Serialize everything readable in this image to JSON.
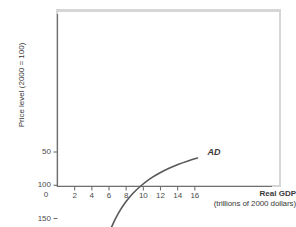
{
  "chart_data": {
    "type": "line",
    "title": "",
    "xlabel": "Real GDP",
    "xlabel_sub": "(trillions of 2000 dollars)",
    "ylabel": "Price level (2000 = 100)",
    "xlim": [
      0,
      18
    ],
    "ylim": [
      0,
      215
    ],
    "grid": false,
    "legend_position": "inline-annotation",
    "xticks": [
      2,
      4,
      6,
      8,
      10,
      12,
      14,
      16
    ],
    "xtick_labels": [
      "2",
      "4",
      "6",
      "8",
      "10",
      "12",
      "14",
      "16"
    ],
    "yticks": [
      50,
      100,
      150
    ],
    "ytick_labels": [
      "50",
      "100",
      "150"
    ],
    "origin_label": "0",
    "annotations": [
      {
        "text": "AD",
        "x": 17.0,
        "y": 52,
        "style": "italic"
      }
    ],
    "series": [
      {
        "name": "AD",
        "label": "AD",
        "color": "#595959",
        "width": 1.6,
        "x": [
          5.3,
          5.8,
          6.4,
          7.1,
          7.9,
          8.8,
          9.8,
          10.8,
          11.9,
          13.0,
          14.1,
          15.2,
          16.3
        ],
        "y": [
          200.0,
          180.0,
          160.0,
          142.0,
          126.0,
          112.0,
          100.0,
          90.0,
          81.5,
          74.5,
          68.5,
          63.5,
          59.0
        ]
      }
    ]
  },
  "figure": {
    "background_color": "#ffffff",
    "frame_color": "#d6d6d6",
    "axis_color": "#707070",
    "text_color": "#3a3a3a"
  }
}
